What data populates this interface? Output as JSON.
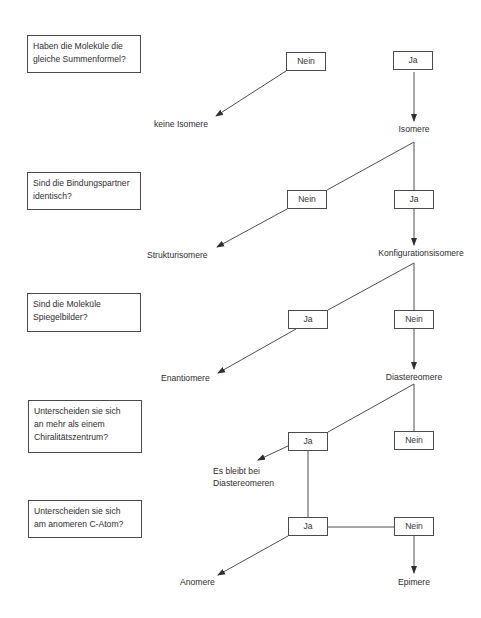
{
  "diagram": {
    "type": "decision-tree",
    "language": "de",
    "questions": [
      {
        "id": "q1",
        "lines": [
          "Haben die Moleküle die",
          "gleiche Summenformel?"
        ]
      },
      {
        "id": "q2",
        "lines": [
          "Sind die Bindungspartner",
          "identisch?"
        ]
      },
      {
        "id": "q3",
        "lines": [
          "Sind die Moleküle",
          "Spiegelbilder?"
        ]
      },
      {
        "id": "q4",
        "lines": [
          "Unterscheiden sie sich",
          "an mehr als einem",
          "Chiralitätszentrum?"
        ]
      },
      {
        "id": "q5",
        "lines": [
          "Unterscheiden sie sich",
          "am anomeren C-Atom?"
        ]
      }
    ],
    "answers": {
      "q1_nein": "Nein",
      "q1_ja": "Ja",
      "q2_nein": "Nein",
      "q2_ja": "Ja",
      "q3_ja": "Ja",
      "q3_nein": "Nein",
      "q4_ja": "Ja",
      "q4_nein": "Nein",
      "q5_ja": "Ja",
      "q5_nein": "Nein"
    },
    "results": {
      "keine_isomere": "keine Isomere",
      "isomere": "Isomere",
      "strukturisomere": "Strukturisomere",
      "konfigurationsisomere": "Konfigurationsisomere",
      "enantiomere": "Enantiomere",
      "diastereomere": "Diastereomere",
      "es_bleibt_line1": "Es bleibt bei",
      "es_bleibt_line2": "Diastereomeren",
      "anomere": "Anomere",
      "epimere": "Epimere"
    },
    "edges": [
      {
        "from": "q1_nein",
        "to": "keine_isomere",
        "arrow": true
      },
      {
        "from": "q1_ja",
        "to": "isomere",
        "arrow": true
      },
      {
        "from": "isomere",
        "to": "q2_nein",
        "arrow": false
      },
      {
        "from": "isomere",
        "to": "q2_ja",
        "arrow": false
      },
      {
        "from": "q2_nein",
        "to": "strukturisomere",
        "arrow": true
      },
      {
        "from": "q2_ja",
        "to": "konfigurationsisomere",
        "arrow": true
      },
      {
        "from": "konfigurationsisomere",
        "to": "q3_ja",
        "arrow": false
      },
      {
        "from": "konfigurationsisomere",
        "to": "q3_nein",
        "arrow": false
      },
      {
        "from": "q3_ja",
        "to": "enantiomere",
        "arrow": true
      },
      {
        "from": "q3_nein",
        "to": "diastereomere",
        "arrow": true
      },
      {
        "from": "diastereomere",
        "to": "q4_ja",
        "arrow": false
      },
      {
        "from": "diastereomere",
        "to": "q4_nein",
        "arrow": false
      },
      {
        "from": "q4_ja",
        "to": "es_bleibt_bei_diastereomeren",
        "arrow": true
      },
      {
        "from": "q4_ja",
        "to": "q5_ja",
        "arrow": false
      },
      {
        "from": "q5_ja",
        "to": "q5_nein",
        "arrow": false
      },
      {
        "from": "q5_ja",
        "to": "anomere",
        "arrow": true
      },
      {
        "from": "q5_nein",
        "to": "epimere",
        "arrow": true
      }
    ],
    "colors": {
      "line": "#3a3a3a",
      "box_border": "#4a4a4a",
      "text": "#2e2e2e",
      "background": "#ffffff"
    }
  }
}
